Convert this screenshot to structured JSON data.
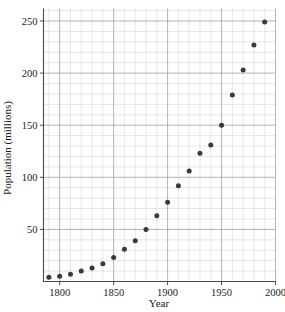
{
  "chart_data": {
    "type": "scatter",
    "title": "",
    "xlabel": "Year",
    "ylabel": "Population (millions)",
    "xlim": [
      1785,
      2000
    ],
    "ylim": [
      0,
      262
    ],
    "grid": true,
    "grid_major_x_step": 50,
    "grid_minor_x_step": 10,
    "grid_major_y_step": 50,
    "grid_minor_y_step": 10,
    "legend": "none",
    "marker": "filled-circle",
    "marker_color": "#3a3a3a",
    "xticks": [
      1800,
      1850,
      1900,
      1950,
      2000
    ],
    "xticklabels": [
      "1800",
      "1850",
      "1900",
      "1950",
      "2000"
    ],
    "yticks": [
      50,
      100,
      150,
      200,
      250
    ],
    "yticklabels": [
      "50",
      "100",
      "150",
      "200",
      "250"
    ],
    "x": [
      1790,
      1800,
      1810,
      1820,
      1830,
      1840,
      1850,
      1860,
      1870,
      1880,
      1890,
      1900,
      1910,
      1920,
      1930,
      1940,
      1950,
      1960,
      1970,
      1980,
      1990
    ],
    "y": [
      4,
      5,
      7,
      10,
      13,
      17,
      23,
      31,
      39,
      50,
      63,
      76,
      92,
      106,
      123,
      131,
      150,
      179,
      203,
      227,
      249
    ],
    "points": [
      {
        "x": 1790,
        "y": 4
      },
      {
        "x": 1800,
        "y": 5
      },
      {
        "x": 1810,
        "y": 7
      },
      {
        "x": 1820,
        "y": 10
      },
      {
        "x": 1830,
        "y": 13
      },
      {
        "x": 1840,
        "y": 17
      },
      {
        "x": 1850,
        "y": 23
      },
      {
        "x": 1860,
        "y": 31
      },
      {
        "x": 1870,
        "y": 39
      },
      {
        "x": 1880,
        "y": 50
      },
      {
        "x": 1890,
        "y": 63
      },
      {
        "x": 1900,
        "y": 76
      },
      {
        "x": 1910,
        "y": 92
      },
      {
        "x": 1920,
        "y": 106
      },
      {
        "x": 1930,
        "y": 123
      },
      {
        "x": 1940,
        "y": 131
      },
      {
        "x": 1950,
        "y": 150
      },
      {
        "x": 1960,
        "y": 179
      },
      {
        "x": 1970,
        "y": 203
      },
      {
        "x": 1980,
        "y": 227
      },
      {
        "x": 1990,
        "y": 249
      }
    ]
  }
}
